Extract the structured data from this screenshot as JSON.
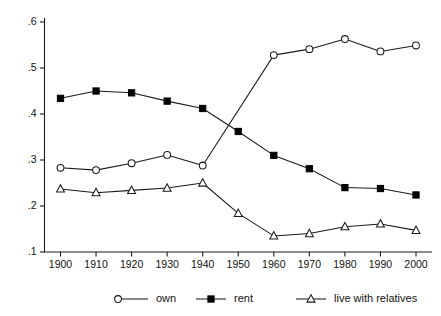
{
  "chart_data": {
    "type": "line",
    "title": "",
    "subtitle": "",
    "xlabel": "",
    "ylabel": "",
    "x": [
      1900,
      1910,
      1920,
      1930,
      1940,
      1950,
      1960,
      1970,
      1980,
      1990,
      2000
    ],
    "xticklabels": [
      "1900",
      "1910",
      "1920",
      "1930",
      "1940",
      "1950",
      "1960",
      "1970",
      "1980",
      "1990",
      "2000"
    ],
    "yticks": [
      0.1,
      0.2,
      0.3,
      0.4,
      0.5,
      0.6
    ],
    "yticklabels": [
      ".1",
      ".2",
      ".3",
      ".4",
      ".5",
      ".6"
    ],
    "xlim": [
      1900,
      2000
    ],
    "ylim": [
      0.1,
      0.6
    ],
    "grid": false,
    "legend_position": "bottom",
    "series": [
      {
        "name": "own",
        "marker": "open-circle",
        "color": "#1a1a1a",
        "x": [
          1900,
          1910,
          1920,
          1930,
          1940,
          1960,
          1970,
          1980,
          1990,
          2000
        ],
        "values": [
          0.283,
          0.278,
          0.293,
          0.311,
          0.288,
          0.528,
          0.541,
          0.563,
          0.536,
          0.549
        ]
      },
      {
        "name": "rent",
        "marker": "filled-square",
        "color": "#000000",
        "x": [
          1900,
          1910,
          1920,
          1930,
          1940,
          1950,
          1960,
          1970,
          1980,
          1990,
          2000
        ],
        "values": [
          0.434,
          0.45,
          0.446,
          0.428,
          0.412,
          0.362,
          0.31,
          0.281,
          0.24,
          0.238,
          0.224
        ]
      },
      {
        "name": "live with relatives",
        "marker": "open-triangle",
        "color": "#1a1a1a",
        "x": [
          1900,
          1910,
          1920,
          1930,
          1940,
          1950,
          1960,
          1970,
          1980,
          1990,
          2000
        ],
        "values": [
          0.237,
          0.229,
          0.234,
          0.239,
          0.25,
          0.184,
          0.135,
          0.14,
          0.155,
          0.161,
          0.147
        ]
      }
    ],
    "legend": [
      {
        "label": "own",
        "marker": "open-circle"
      },
      {
        "label": "rent",
        "marker": "filled-square"
      },
      {
        "label": "live with relatives",
        "marker": "open-triangle"
      }
    ]
  }
}
